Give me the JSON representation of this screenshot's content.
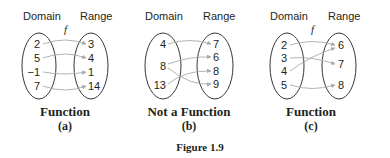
{
  "figure": {
    "label": "Figure 1.9",
    "panels": [
      {
        "id": "a",
        "domain_label": "Domain",
        "range_label": "Range",
        "function_name": "f",
        "domain": [
          "2",
          "5",
          "−1",
          "7"
        ],
        "range": [
          "3",
          "4",
          "1",
          "14"
        ],
        "mappings": [
          [
            "2",
            "3"
          ],
          [
            "5",
            "4"
          ],
          [
            "−1",
            "1"
          ],
          [
            "7",
            "14"
          ]
        ],
        "caption": "Function",
        "sublabel": "(a)"
      },
      {
        "id": "b",
        "domain_label": "Domain",
        "range_label": "Range",
        "function_name": "",
        "domain": [
          "4",
          "8",
          "13"
        ],
        "range": [
          "7",
          "6",
          "8",
          "9"
        ],
        "mappings": [
          [
            "4",
            "7"
          ],
          [
            "8",
            "6"
          ],
          [
            "8",
            "9"
          ],
          [
            "13",
            "8"
          ]
        ],
        "caption": "Not a Function",
        "sublabel": "(b)"
      },
      {
        "id": "c",
        "domain_label": "Domain",
        "range_label": "Range",
        "function_name": "f",
        "domain": [
          "2",
          "3",
          "4",
          "5"
        ],
        "range": [
          "6",
          "7",
          "8"
        ],
        "mappings": [
          [
            "2",
            "6"
          ],
          [
            "3",
            "7"
          ],
          [
            "4",
            "6"
          ],
          [
            "5",
            "8"
          ]
        ],
        "caption": "Function",
        "sublabel": "(c)"
      }
    ]
  },
  "colors": {
    "text": "#231f20",
    "arrow": "#a7a9ac"
  }
}
